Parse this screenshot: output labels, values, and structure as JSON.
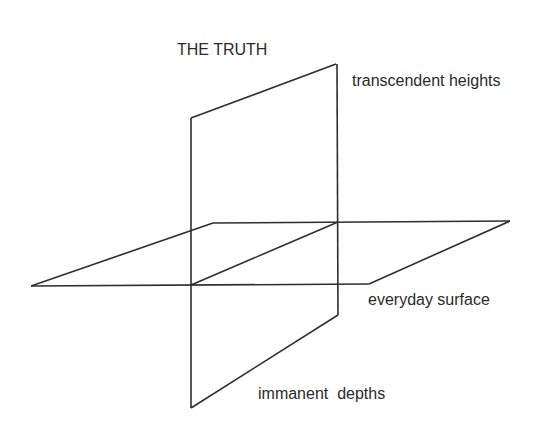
{
  "diagram": {
    "title": "THE TRUTH",
    "labels": {
      "heights": "transcendent heights",
      "surface": "everyday surface",
      "depths": "immanent  depths"
    },
    "colors": {
      "background": "#ffffff",
      "line": "#2e2e2e",
      "text": "#2a2a2a"
    },
    "shapes": {
      "vertical_plane": {
        "description": "vertical parallelogram (transcendent above, immanent below)",
        "points": [
          [
            191,
            118
          ],
          [
            336,
            64
          ],
          [
            338,
            315
          ],
          [
            191,
            408
          ]
        ]
      },
      "horizontal_plane": {
        "description": "horizontal parallelogram (everyday surface)",
        "points": [
          [
            31,
            286
          ],
          [
            213,
            223
          ],
          [
            510,
            221
          ],
          [
            369,
            284
          ]
        ]
      },
      "intersection_line": {
        "description": "line where planes intersect",
        "points": [
          [
            191,
            285
          ],
          [
            338,
            222
          ]
        ]
      }
    }
  }
}
